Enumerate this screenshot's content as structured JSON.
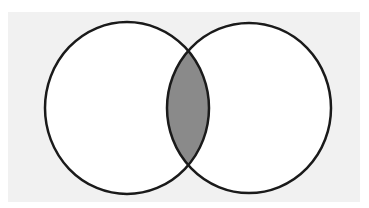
{
  "diagram": {
    "type": "venn",
    "title": "",
    "sets": [
      {
        "name": "left-set",
        "label": ""
      },
      {
        "name": "right-set",
        "label": ""
      }
    ],
    "shaded_region": "intersection",
    "colors": {
      "background_panel": "#f1f1f1",
      "circle_fill": "#ffffff",
      "stroke": "#1a1a1a",
      "intersection_fill": "#8a8a8a"
    }
  }
}
